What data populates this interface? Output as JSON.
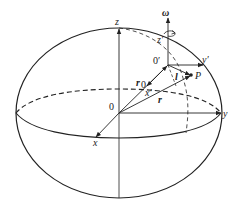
{
  "diagram": {
    "colors": {
      "stroke": "#222222",
      "background": "#ffffff"
    },
    "labels": {
      "z": "z",
      "y": "y",
      "x": "x",
      "origin": "0",
      "origin_prime": "0′",
      "z_prime": "z′",
      "y_prime": "y′",
      "x_prime": "x′",
      "omega": "ω",
      "r0": "r",
      "r0_sub": "0",
      "r": "r",
      "l": "l",
      "P": "P"
    },
    "elements": [
      "outer-ellipse (sphere outline)",
      "equator (dashed back, solid front)",
      "meridian (dashed)",
      "global axes x, y, z from origin 0",
      "local axes x′, y′, z′ from origin 0′",
      "rotation vector ω with curl arrow",
      "position vectors r₀, r, l to point P"
    ]
  }
}
